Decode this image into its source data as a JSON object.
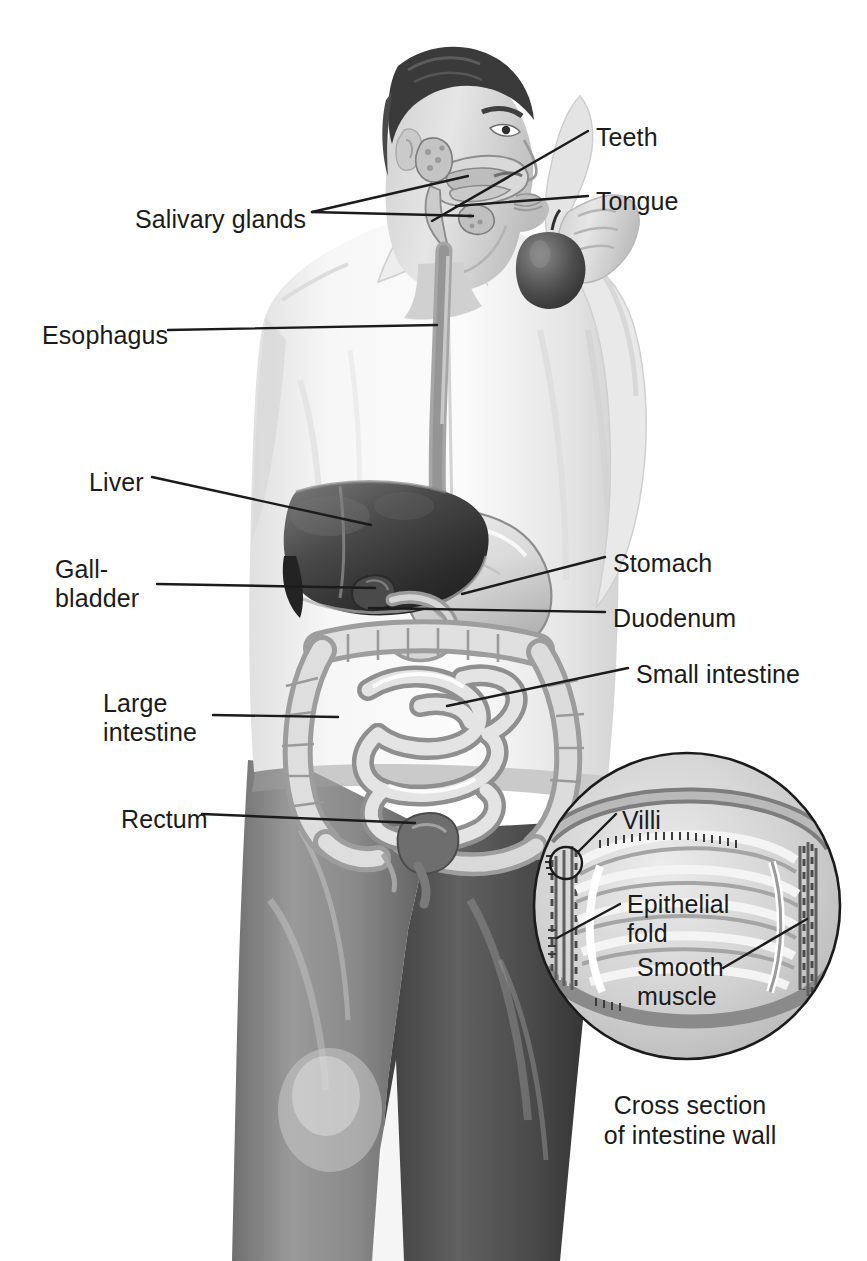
{
  "figure": {
    "caption_line1": "Cross section",
    "caption_line2": "of intestine wall",
    "palette": {
      "ink": "#1b1b1b",
      "paper": "#ffffff",
      "shirt_light": "#f4f4f4",
      "shirt_shadow": "#dcdcdc",
      "skin": "#d6d6d6",
      "hair_dark": "#3a3a3a",
      "liver_dark": "#2e2e2e",
      "liver_mid": "#555555",
      "organ_light": "#e2e2e2",
      "organ_mid": "#c2c2c2",
      "organ_outline": "#8a8a8a",
      "trouser_dark": "#4a4a4a",
      "trouser_darker": "#3b3b3b",
      "apple_dark": "#4b4b4b",
      "inset_fill": "#d9d9d9",
      "inset_mid": "#bfbfbf",
      "inset_light": "#efefef"
    }
  },
  "labels": [
    {
      "id": "teeth",
      "text": "Teeth",
      "x": 596,
      "y": 123,
      "align": "left"
    },
    {
      "id": "tongue",
      "text": "Tongue",
      "x": 596,
      "y": 187,
      "align": "left"
    },
    {
      "id": "salivary-glands",
      "text": "Salivary glands",
      "x": 135,
      "y": 205,
      "align": "left"
    },
    {
      "id": "esophagus",
      "text": "Esophagus",
      "x": 42,
      "y": 321,
      "align": "left"
    },
    {
      "id": "liver",
      "text": "Liver",
      "x": 89,
      "y": 468,
      "align": "left"
    },
    {
      "id": "gallbladder",
      "text": "Gall-\nbladder",
      "x": 55,
      "y": 555,
      "align": "left"
    },
    {
      "id": "stomach",
      "text": "Stomach",
      "x": 613,
      "y": 549,
      "align": "left"
    },
    {
      "id": "duodenum",
      "text": "Duodenum",
      "x": 613,
      "y": 604,
      "align": "left"
    },
    {
      "id": "small-intestine",
      "text": "Small intestine",
      "x": 636,
      "y": 660,
      "align": "left"
    },
    {
      "id": "large-intestine",
      "text": "Large\nintestine",
      "x": 103,
      "y": 689,
      "align": "left"
    },
    {
      "id": "rectum",
      "text": "Rectum",
      "x": 121,
      "y": 805,
      "align": "left"
    },
    {
      "id": "villi",
      "text": "Villi",
      "x": 622,
      "y": 806,
      "align": "left"
    },
    {
      "id": "epithelial-fold",
      "text": "Epithelial\nfold",
      "x": 627,
      "y": 890,
      "align": "left"
    },
    {
      "id": "smooth-muscle",
      "text": "Smooth\nmuscle",
      "x": 637,
      "y": 953,
      "align": "left"
    }
  ],
  "leaders": [
    {
      "id": "teeth-leader",
      "points": "588,131 432,221"
    },
    {
      "id": "tongue-leader",
      "points": "588,196 456,206"
    },
    {
      "id": "salivary-upper-leader",
      "points": "312,212 468,176"
    },
    {
      "id": "salivary-lower-leader",
      "points": "312,212 473,216"
    },
    {
      "id": "esophagus-leader",
      "points": "168,330 437,325"
    },
    {
      "id": "liver-leader",
      "points": "152,477 371,525"
    },
    {
      "id": "gallbladder-leader",
      "points": "157,584 375,588"
    },
    {
      "id": "stomach-leader",
      "points": "605,557 462,594"
    },
    {
      "id": "duodenum-leader",
      "points": "605,612 369,608"
    },
    {
      "id": "small-intestine-leader",
      "points": "628,668 447,706"
    },
    {
      "id": "large-intestine-leader",
      "points": "213,715 338,717"
    },
    {
      "id": "rectum-leader",
      "points": "202,814 415,823"
    },
    {
      "id": "villi-leader",
      "points": "616,814 578,852"
    },
    {
      "id": "epithelial-fold-leader",
      "points": "620,904 557,938"
    },
    {
      "id": "smooth-muscle-leader",
      "points": "723,968 807,919"
    }
  ],
  "inset": {
    "circle": {
      "cx": 687,
      "cy": 906,
      "r": 153
    },
    "villi_marker": {
      "cx": 566,
      "cy": 863,
      "r": 16
    }
  },
  "icons": {
    "villi_marker": "magnifier-circle-icon"
  }
}
